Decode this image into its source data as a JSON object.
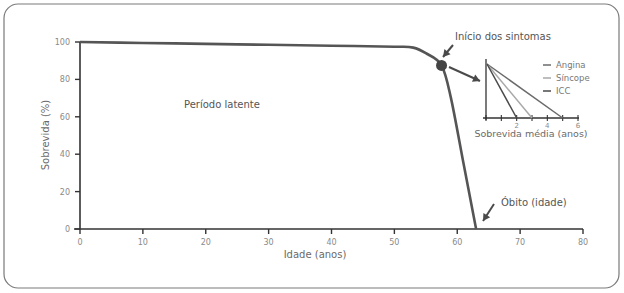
{
  "chart_data": [
    {
      "type": "line",
      "title": "",
      "xlabel": "Idade (anos)",
      "ylabel": "Sobrevida (%)",
      "xlim": [
        0,
        80
      ],
      "ylim": [
        0,
        100
      ],
      "x_ticks": [
        0,
        10,
        20,
        30,
        40,
        50,
        60,
        70,
        80
      ],
      "y_ticks": [
        0,
        20,
        40,
        60,
        80,
        100
      ],
      "grid": false,
      "series": [
        {
          "name": "Sobrevida",
          "x": [
            0,
            10,
            20,
            30,
            40,
            50,
            53,
            55,
            57.5,
            59,
            61,
            63
          ],
          "y": [
            100,
            99.5,
            99,
            98.5,
            98,
            97.5,
            97,
            94,
            87.5,
            70,
            35,
            0
          ],
          "color": "#555555"
        }
      ],
      "annotations": [
        {
          "text": "Período latente",
          "x": 25,
          "y": 65
        },
        {
          "text": "Início dos sintomas",
          "x": 57.5,
          "y": 87.5,
          "marker": "dot"
        },
        {
          "text": "Óbito (idade)",
          "x": 63,
          "y": 0,
          "marker": "arrow"
        }
      ]
    },
    {
      "type": "line",
      "title": "",
      "xlabel": "Sobrevida média (anos)",
      "ylabel": "",
      "xlim": [
        0,
        6
      ],
      "x_ticks": [
        0,
        1,
        2,
        3,
        4,
        5,
        6
      ],
      "x_tick_labels": [
        "",
        "",
        "2",
        "",
        "4",
        "",
        "6"
      ],
      "legend_position": "upper right",
      "series": [
        {
          "name": "Angina",
          "x": [
            0,
            5
          ],
          "y": [
            100,
            0
          ],
          "color": "#6b6b6b"
        },
        {
          "name": "Síncope",
          "x": [
            0,
            3
          ],
          "y": [
            100,
            0
          ],
          "color": "#a8a8a8"
        },
        {
          "name": "ICC",
          "x": [
            0,
            2
          ],
          "y": [
            100,
            0
          ],
          "color": "#4a4a4a"
        }
      ]
    }
  ],
  "labels": {
    "ylabel": "Sobrevida (%)",
    "xlabel": "Idade (anos)",
    "latent": "Período latente",
    "symptoms": "Início dos sintomas",
    "death": "Óbito (idade)",
    "inset_xlabel": "Sobrevida média (anos)",
    "legend": [
      "Angina",
      "Síncope",
      "ICC"
    ]
  },
  "colors": {
    "frame": "#7a7a7a",
    "axis": "#333333",
    "curve": "#555555",
    "dot": "#444444",
    "arrow": "#4a4a4a",
    "tick_text": "#8a8a8a"
  }
}
